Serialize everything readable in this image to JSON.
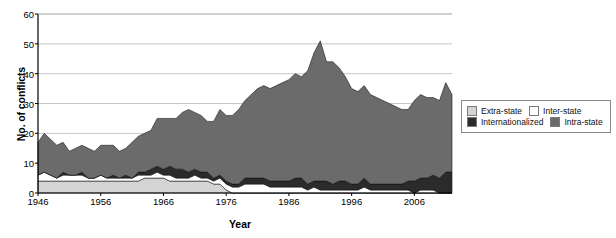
{
  "chart_data": {
    "type": "area",
    "title": "",
    "xlabel": "Year",
    "ylabel": "No. of conflicts",
    "xlim": [
      1946,
      2012
    ],
    "ylim": [
      0,
      60
    ],
    "grid": true,
    "stacked": true,
    "legend_position": "right",
    "xticks": [
      1946,
      1956,
      1966,
      1976,
      1986,
      1996,
      2006
    ],
    "yticks": [
      0,
      10,
      20,
      30,
      40,
      50,
      60
    ],
    "x": [
      1946,
      1947,
      1948,
      1949,
      1950,
      1951,
      1952,
      1953,
      1954,
      1955,
      1956,
      1957,
      1958,
      1959,
      1960,
      1961,
      1962,
      1963,
      1964,
      1965,
      1966,
      1967,
      1968,
      1969,
      1970,
      1971,
      1972,
      1973,
      1974,
      1975,
      1976,
      1977,
      1978,
      1979,
      1980,
      1981,
      1982,
      1983,
      1984,
      1985,
      1986,
      1987,
      1988,
      1989,
      1990,
      1991,
      1992,
      1993,
      1994,
      1995,
      1996,
      1997,
      1998,
      1999,
      2000,
      2001,
      2002,
      2003,
      2004,
      2005,
      2006,
      2007,
      2008,
      2009,
      2010,
      2011,
      2012
    ],
    "series": [
      {
        "name": "Extra-state",
        "color": "#d4d4d4",
        "values": [
          4,
          4,
          4,
          4,
          4,
          4,
          4,
          4,
          4,
          4,
          4,
          4,
          4,
          4,
          4,
          4,
          4,
          5,
          5,
          5,
          5,
          4,
          4,
          4,
          4,
          4,
          4,
          4,
          3,
          3,
          1,
          0,
          0,
          0,
          0,
          0,
          0,
          0,
          0,
          0,
          0,
          0,
          0,
          0,
          0,
          0,
          0,
          0,
          0,
          0,
          0,
          0,
          0,
          0,
          0,
          0,
          0,
          0,
          0,
          0,
          0,
          0,
          0,
          0,
          0,
          0,
          0
        ]
      },
      {
        "name": "Inter-state",
        "color": "#ffffff",
        "values": [
          2,
          3,
          2,
          1,
          2,
          2,
          2,
          2,
          1,
          1,
          2,
          1,
          1,
          1,
          1,
          1,
          2,
          1,
          1,
          2,
          1,
          2,
          1,
          1,
          1,
          2,
          1,
          1,
          1,
          2,
          2,
          2,
          2,
          3,
          3,
          3,
          3,
          2,
          2,
          2,
          2,
          2,
          2,
          1,
          2,
          1,
          1,
          1,
          1,
          1,
          1,
          1,
          2,
          1,
          1,
          1,
          1,
          1,
          1,
          1,
          0,
          1,
          1,
          1,
          0,
          0,
          0
        ]
      },
      {
        "name": "Internationalized",
        "color": "#2b2b2b",
        "values": [
          0,
          0,
          0,
          0,
          1,
          0,
          0,
          1,
          0,
          0,
          0,
          0,
          1,
          0,
          1,
          0,
          1,
          1,
          2,
          2,
          2,
          3,
          3,
          3,
          2,
          2,
          2,
          2,
          1,
          1,
          1,
          1,
          1,
          2,
          2,
          2,
          2,
          2,
          2,
          2,
          2,
          3,
          3,
          2,
          2,
          3,
          3,
          2,
          3,
          3,
          2,
          2,
          3,
          2,
          2,
          2,
          2,
          2,
          2,
          3,
          4,
          4,
          4,
          5,
          5,
          7,
          7
        ]
      },
      {
        "name": "Intra-state",
        "color": "#6b6b6b",
        "values": [
          11,
          13,
          12,
          11,
          10,
          8,
          9,
          9,
          10,
          9,
          10,
          11,
          10,
          9,
          9,
          12,
          12,
          13,
          13,
          16,
          17,
          16,
          17,
          19,
          21,
          19,
          19,
          17,
          19,
          22,
          22,
          23,
          25,
          26,
          28,
          30,
          31,
          31,
          32,
          33,
          34,
          35,
          34,
          38,
          43,
          47,
          40,
          41,
          38,
          35,
          32,
          31,
          31,
          30,
          29,
          28,
          27,
          26,
          25,
          24,
          27,
          28,
          27,
          26,
          26,
          30,
          26
        ]
      }
    ],
    "totals_note": "stacked totals peak at about 52 in 1991-1992"
  },
  "legend": {
    "entries": [
      {
        "label": "Extra-state",
        "color": "#d4d4d4"
      },
      {
        "label": "Inter-state",
        "color": "#ffffff"
      },
      {
        "label": "Internationalized",
        "color": "#2b2b2b"
      },
      {
        "label": "Intra-state",
        "color": "#6b6b6b"
      }
    ]
  },
  "axes": {
    "y_title": "No. of conflicts",
    "x_title": "Year",
    "y_ticks": [
      "0",
      "10",
      "20",
      "30",
      "40",
      "50",
      "60"
    ],
    "x_ticks": [
      "1946",
      "1956",
      "1966",
      "1976",
      "1986",
      "1996",
      "2006"
    ]
  },
  "colors": {
    "axis": "#000000",
    "grid": "#b8b8b8",
    "extra_state": "#d4d4d4",
    "inter_state": "#ffffff",
    "internationalized": "#2b2b2b",
    "intra_state": "#6b6b6b",
    "legend_border": "#8a8a8a"
  }
}
